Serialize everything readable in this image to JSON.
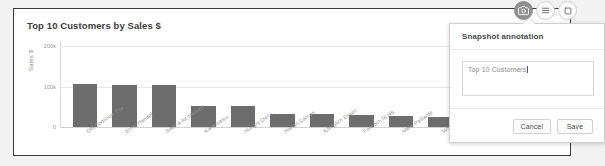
{
  "card": {
    "title": "Top 10 Customers by Sales $"
  },
  "icons": {
    "snapshot": "camera-icon",
    "menu": "hamburger-icon",
    "expand": "expand-icon"
  },
  "popup": {
    "title": "Snapshot annotation",
    "annotation_value": "Top 10 Customers",
    "annotation_placeholder": "",
    "cancel_label": "Cancel",
    "save_label": "Save"
  },
  "chart_data": {
    "type": "bar",
    "title": "Top 10 Customers by Sales $",
    "xlabel": "",
    "ylabel": "Sales $",
    "ylim": [
      0,
      210000
    ],
    "yticks": [
      0,
      100000,
      200000
    ],
    "ytick_labels": [
      "0",
      "100k",
      "200k"
    ],
    "grid": true,
    "legend": false,
    "categories": [
      "Old Dominion Tire",
      "Ernst Handel",
      "Save-a-lot Markets",
      "Kanematsu ...",
      "Hungry Owl ...",
      "Hanari Carnes",
      "Königlich Essen",
      "Folk och fä HB",
      "Mere Paillarde",
      "White Clover ...",
      "Others"
    ],
    "values": [
      106000,
      104000,
      104000,
      52000,
      52000,
      33000,
      31000,
      30000,
      28000,
      24000,
      242000
    ],
    "bar_color": "#6d6d6d",
    "others_bar_color": "#9a9a9a",
    "annotations": []
  }
}
